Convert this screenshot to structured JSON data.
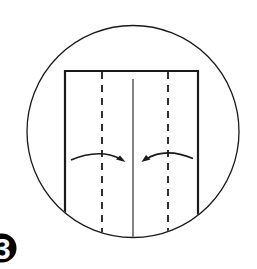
{
  "diagram": {
    "type": "origami-step",
    "step_number": "3",
    "colors": {
      "background": "#ffffff",
      "line": "#1a1a1a",
      "badge": "#000000",
      "badge_text": "#ffffff"
    },
    "circle": {
      "cx": 133,
      "cy": 131.5,
      "r": 106,
      "stroke_width": 1.3
    },
    "paper": {
      "left_x": 65,
      "right_x": 198,
      "top_y": 71,
      "stroke_width": 2.2
    },
    "creases": [
      {
        "name": "left-valley-fold",
        "style": "dashed",
        "x": 102
      },
      {
        "name": "center-crease",
        "style": "solid",
        "x": 133,
        "top_y": 79
      },
      {
        "name": "right-valley-fold",
        "style": "dashed",
        "x": 168
      }
    ],
    "arrows": [
      {
        "name": "left-fold-arrow",
        "direction": "right",
        "from_x": 71,
        "to_x": 124
      },
      {
        "name": "right-fold-arrow",
        "direction": "left",
        "from_x": 192,
        "to_x": 142
      }
    ]
  }
}
